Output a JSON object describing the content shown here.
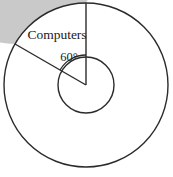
{
  "figure": {
    "type": "pie-chart-diagram",
    "background_color": "#ffffff",
    "outline_color": "#2b2b2b",
    "shaded_color": "#c9c9c9",
    "unshaded_color": "#ffffff",
    "center": {
      "x": 86,
      "y": 85
    },
    "outer_radius": 82,
    "inner_radius": 28,
    "angle_arc_radius": 30,
    "labels": {
      "sector_label": "Computers",
      "angle_label": "60°"
    },
    "label_positions": {
      "sector_label": {
        "x": 57,
        "y": 39
      },
      "angle_label": {
        "x": 69,
        "y": 61
      }
    },
    "sectors": [
      {
        "name": "Computers",
        "angle_degrees": 60,
        "start_angle_from_top_ccw": 0,
        "end_angle_from_top_ccw": 60,
        "fill": "#ffffff",
        "labeled": true
      },
      {
        "name": "Other",
        "angle_degrees": 300,
        "start_angle_from_top_ccw": 60,
        "end_angle_from_top_ccw": 360,
        "fill": "#c9c9c9",
        "labeled": false
      }
    ]
  },
  "chart_data": {
    "type": "pie",
    "title": "",
    "categories": [
      "Computers",
      "Other"
    ],
    "values": [
      60,
      300
    ],
    "value_unit": "degrees",
    "percentages": [
      16.67,
      83.33
    ],
    "labels_shown": [
      "Computers",
      "60°"
    ],
    "colors": [
      "#ffffff",
      "#c9c9c9"
    ],
    "legend": "none",
    "annotations": [
      {
        "text": "Computers",
        "target": "white-sector"
      },
      {
        "text": "60°",
        "target": "central-angle-of-white-sector"
      }
    ]
  }
}
